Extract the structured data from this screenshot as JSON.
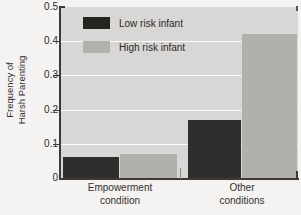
{
  "chart_data": {
    "type": "bar",
    "title": "",
    "xlabel": "",
    "ylabel_line1": "Frequency of",
    "ylabel_line2": "Harsh Parenting",
    "categories": [
      "Empowerment condition",
      "Other conditions"
    ],
    "category_lines": [
      {
        "line1": "Empowerment",
        "line2": "condition"
      },
      {
        "line1": "Other",
        "line2": "conditions"
      }
    ],
    "series": [
      {
        "name": "Low risk infant",
        "color": "#302e2c",
        "values": [
          0.06,
          0.17
        ]
      },
      {
        "name": "High risk infant",
        "color": "#b2b0ad",
        "values": [
          0.07,
          0.42
        ]
      }
    ],
    "ylim": [
      0,
      0.5
    ],
    "ytick_labels": [
      "0.5",
      "0.4",
      "0.3",
      "0.2",
      "0.1",
      "0"
    ],
    "ytick_values": [
      0.5,
      0.4,
      0.3,
      0.2,
      0.1,
      0
    ],
    "grid": "horizontal",
    "legend_position": "upper-left-inside",
    "plot_background_color": "#d8d7d5",
    "figure_background_color": "#f4f3f1",
    "axis_color": "#3c3936",
    "gridline_color": "#fbfbfa"
  },
  "legend": {
    "items": [
      {
        "label": "Low risk infant",
        "swatch": "low"
      },
      {
        "label": "High risk infant",
        "swatch": "high"
      }
    ]
  }
}
